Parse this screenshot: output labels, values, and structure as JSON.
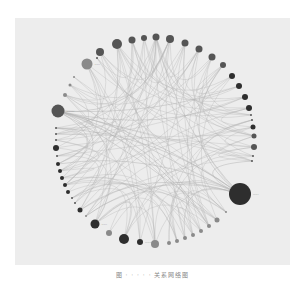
{
  "figure": {
    "type": "circular-network-diagram",
    "caption": "图 · · · · · 关系网络图",
    "colors": {
      "background": "#ffffff",
      "panel": "#ededed",
      "edge": "#b4b4b4",
      "node_dark": "#2e2e2e",
      "node_mid": "#555555",
      "node_light": "#8a8a8a"
    },
    "center": [
      153,
      140
    ],
    "radius": 98,
    "nodes": [
      {
        "x": 100,
        "y": 52,
        "r": 4,
        "shade": "mid",
        "label": ""
      },
      {
        "x": 117,
        "y": 44,
        "r": 5,
        "shade": "mid",
        "label": ""
      },
      {
        "x": 132,
        "y": 40,
        "r": 3.5,
        "shade": "mid",
        "label": ""
      },
      {
        "x": 144,
        "y": 38,
        "r": 3,
        "shade": "mid",
        "label": ""
      },
      {
        "x": 156,
        "y": 37,
        "r": 3.5,
        "shade": "mid",
        "label": ""
      },
      {
        "x": 170,
        "y": 39,
        "r": 4,
        "shade": "mid",
        "label": ""
      },
      {
        "x": 185,
        "y": 43,
        "r": 3.5,
        "shade": "mid",
        "label": ""
      },
      {
        "x": 199,
        "y": 49,
        "r": 3.5,
        "shade": "mid",
        "label": ""
      },
      {
        "x": 212,
        "y": 57,
        "r": 3.5,
        "shade": "mid",
        "label": ""
      },
      {
        "x": 223,
        "y": 65,
        "r": 3,
        "shade": "mid",
        "label": ""
      },
      {
        "x": 232,
        "y": 76,
        "r": 3,
        "shade": "dark",
        "label": ""
      },
      {
        "x": 239,
        "y": 86,
        "r": 3,
        "shade": "dark",
        "label": ""
      },
      {
        "x": 245,
        "y": 97,
        "r": 3,
        "shade": "dark",
        "label": ""
      },
      {
        "x": 249,
        "y": 108,
        "r": 3,
        "shade": "dark",
        "label": ""
      },
      {
        "x": 251,
        "y": 115,
        "r": 1,
        "shade": "mid",
        "label": ""
      },
      {
        "x": 252,
        "y": 120,
        "r": 1,
        "shade": "mid",
        "label": ""
      },
      {
        "x": 253,
        "y": 127,
        "r": 2.5,
        "shade": "dark",
        "label": ""
      },
      {
        "x": 254,
        "y": 136,
        "r": 2.5,
        "shade": "mid",
        "label": ""
      },
      {
        "x": 254,
        "y": 147,
        "r": 3,
        "shade": "mid",
        "label": ""
      },
      {
        "x": 253,
        "y": 156,
        "r": 1,
        "shade": "mid",
        "label": ""
      },
      {
        "x": 252,
        "y": 161,
        "r": 1,
        "shade": "mid",
        "label": ""
      },
      {
        "x": 240,
        "y": 194,
        "r": 11,
        "shade": "dark",
        "label": "·····"
      },
      {
        "x": 226,
        "y": 212,
        "r": 1,
        "shade": "light",
        "label": ""
      },
      {
        "x": 217,
        "y": 220,
        "r": 2.5,
        "shade": "light",
        "label": ""
      },
      {
        "x": 209,
        "y": 226,
        "r": 2,
        "shade": "light",
        "label": ""
      },
      {
        "x": 201,
        "y": 231,
        "r": 2,
        "shade": "light",
        "label": ""
      },
      {
        "x": 193,
        "y": 235,
        "r": 2,
        "shade": "light",
        "label": ""
      },
      {
        "x": 185,
        "y": 238,
        "r": 2,
        "shade": "light",
        "label": ""
      },
      {
        "x": 177,
        "y": 241,
        "r": 2,
        "shade": "light",
        "label": ""
      },
      {
        "x": 169,
        "y": 243,
        "r": 2,
        "shade": "light",
        "label": ""
      },
      {
        "x": 155,
        "y": 244,
        "r": 4,
        "shade": "light",
        "label": ""
      },
      {
        "x": 140,
        "y": 242,
        "r": 3,
        "shade": "dark",
        "label": "······"
      },
      {
        "x": 124,
        "y": 239,
        "r": 5,
        "shade": "dark",
        "label": ""
      },
      {
        "x": 109,
        "y": 233,
        "r": 3,
        "shade": "light",
        "label": ""
      },
      {
        "x": 95,
        "y": 224,
        "r": 4.5,
        "shade": "dark",
        "label": "·····"
      },
      {
        "x": 86,
        "y": 216,
        "r": 1,
        "shade": "light",
        "label": ""
      },
      {
        "x": 80,
        "y": 210,
        "r": 2.5,
        "shade": "dark",
        "label": ""
      },
      {
        "x": 75,
        "y": 203,
        "r": 1,
        "shade": "mid",
        "label": ""
      },
      {
        "x": 72,
        "y": 198,
        "r": 1,
        "shade": "mid",
        "label": ""
      },
      {
        "x": 68,
        "y": 192,
        "r": 2,
        "shade": "dark",
        "label": ""
      },
      {
        "x": 65,
        "y": 185,
        "r": 2,
        "shade": "dark",
        "label": ""
      },
      {
        "x": 62,
        "y": 178,
        "r": 2,
        "shade": "dark",
        "label": ""
      },
      {
        "x": 60,
        "y": 171,
        "r": 2,
        "shade": "dark",
        "label": ""
      },
      {
        "x": 58,
        "y": 164,
        "r": 2,
        "shade": "dark",
        "label": ""
      },
      {
        "x": 57,
        "y": 156,
        "r": 1,
        "shade": "mid",
        "label": ""
      },
      {
        "x": 56,
        "y": 148,
        "r": 3,
        "shade": "dark",
        "label": ""
      },
      {
        "x": 56,
        "y": 140,
        "r": 1,
        "shade": "mid",
        "label": ""
      },
      {
        "x": 56,
        "y": 134,
        "r": 1,
        "shade": "mid",
        "label": ""
      },
      {
        "x": 56,
        "y": 128,
        "r": 1,
        "shade": "mid",
        "label": ""
      },
      {
        "x": 58,
        "y": 111,
        "r": 6.5,
        "shade": "mid",
        "label": "·······"
      },
      {
        "x": 65,
        "y": 95,
        "r": 2,
        "shade": "light",
        "label": ""
      },
      {
        "x": 70,
        "y": 85,
        "r": 1.5,
        "shade": "light",
        "label": ""
      },
      {
        "x": 74,
        "y": 77,
        "r": 1,
        "shade": "light",
        "label": ""
      },
      {
        "x": 87,
        "y": 64,
        "r": 5.5,
        "shade": "light",
        "label": "·····"
      },
      {
        "x": 97,
        "y": 58,
        "r": 1,
        "shade": "mid",
        "label": ""
      }
    ]
  }
}
